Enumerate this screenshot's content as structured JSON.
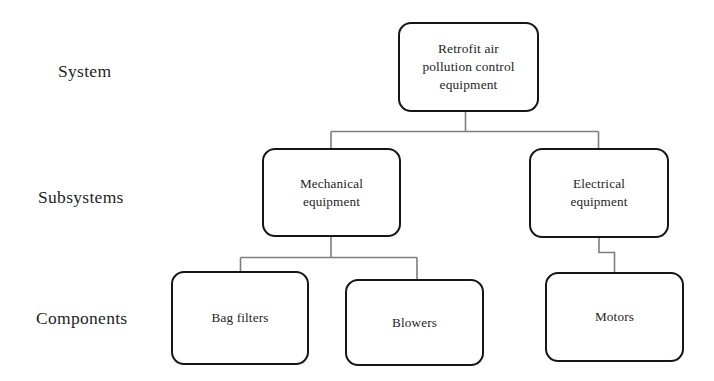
{
  "diagram": {
    "background_color": "#ffffff",
    "node_border_color": "#161616",
    "connector_color": "#7a7a7a",
    "tier_labels": [
      {
        "id": "system",
        "label": "System"
      },
      {
        "id": "subsystems",
        "label": "Subsystems"
      },
      {
        "id": "components",
        "label": "Components"
      }
    ],
    "nodes": [
      {
        "id": "retrofit-air-pollution-control-equipment",
        "label": "Retrofit air\npollution control\nequipment",
        "tier": "System"
      },
      {
        "id": "mechanical-equipment",
        "label": "Mechanical\nequipment",
        "tier": "Subsystems"
      },
      {
        "id": "electrical-equipment",
        "label": "Electrical\nequipment",
        "tier": "Subsystems"
      },
      {
        "id": "bag-filters",
        "label": "Bag filters",
        "tier": "Components"
      },
      {
        "id": "blowers",
        "label": "Blowers",
        "tier": "Components"
      },
      {
        "id": "motors",
        "label": "Motors",
        "tier": "Components"
      }
    ],
    "edges": [
      {
        "from": "retrofit-air-pollution-control-equipment",
        "to": "mechanical-equipment"
      },
      {
        "from": "retrofit-air-pollution-control-equipment",
        "to": "electrical-equipment"
      },
      {
        "from": "mechanical-equipment",
        "to": "bag-filters"
      },
      {
        "from": "mechanical-equipment",
        "to": "blowers"
      },
      {
        "from": "electrical-equipment",
        "to": "motors"
      }
    ]
  }
}
